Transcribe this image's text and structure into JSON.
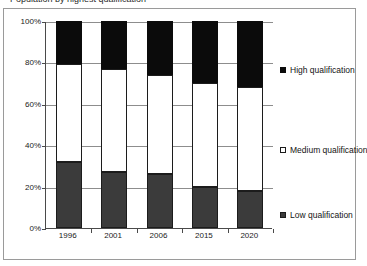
{
  "title_fragment": "Population by highest qualification",
  "chart_data": {
    "type": "bar",
    "subtype": "stacked-percentage",
    "title": "",
    "xlabel": "",
    "ylabel": "",
    "ylim": [
      0,
      100
    ],
    "y_tick_labels": [
      "100%",
      "80%",
      "60%",
      "40%",
      "20%",
      "0%"
    ],
    "y_ticks": [
      100,
      80,
      60,
      40,
      20,
      0
    ],
    "grid": true,
    "legend_position": "right",
    "categories": [
      "1996",
      "2001",
      "2006",
      "2015",
      "2020"
    ],
    "series": [
      {
        "name": "Low qualification",
        "color": "#3b3b3b",
        "values": [
          32,
          27,
          26,
          20,
          18
        ]
      },
      {
        "name": "Medium qualification",
        "color": "#ffffff",
        "values": [
          47,
          50,
          48,
          50,
          50
        ]
      },
      {
        "name": "High qualification",
        "color": "#0b0b0b",
        "values": [
          21,
          23,
          26,
          30,
          32
        ]
      }
    ]
  },
  "legend": {
    "entries": [
      {
        "label": "High qualification",
        "swatch": "black-square-icon"
      },
      {
        "label": "Medium qualification",
        "swatch": "white-square-icon"
      },
      {
        "label": "Low qualification",
        "swatch": "gray-square-icon"
      }
    ]
  }
}
